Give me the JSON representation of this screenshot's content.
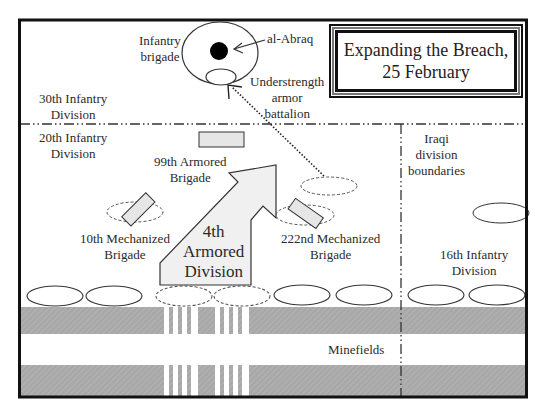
{
  "title": {
    "line1": "Expanding the Breach,",
    "line2": "25 February"
  },
  "labels": {
    "infantry_brigade_1": "Infantry",
    "infantry_brigade_2": "brigade",
    "al_abraq": "al-Abraq",
    "understrength_1": "Understrength",
    "understrength_2": "armor",
    "understrength_3": "battalion",
    "div30_1": "30th Infantry",
    "div30_2": "Division",
    "div20_1": "20th Infantry",
    "div20_2": "Division",
    "bde99_1": "99th Armored",
    "bde99_2": "Brigade",
    "iraqi_1": "Iraqi",
    "iraqi_2": "division",
    "iraqi_3": "boundaries",
    "bde10_1": "10th Mechanized",
    "bde10_2": "Brigade",
    "armd4_1": "4th",
    "armd4_2": "Armored",
    "armd4_3": "Division",
    "bde222_1": "222nd Mechanized",
    "bde222_2": "Brigade",
    "div16_1": "16th Infantry",
    "div16_2": "Division",
    "minefields": "Minefields"
  },
  "colors": {
    "frame": "#111111",
    "unit_fill": "#e6e6e6",
    "arrow_fill": "#f0f0f0",
    "minefield": "#a9a9a9",
    "line": "#333333"
  }
}
